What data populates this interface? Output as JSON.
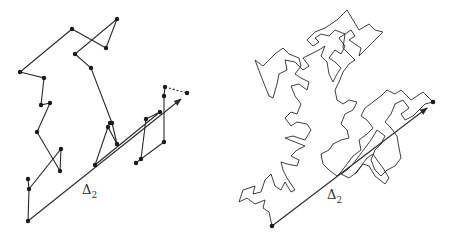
{
  "figure": {
    "left": {
      "label_symbol": "Δ",
      "label_subscript": "2",
      "label_pos": [
        82,
        182
      ],
      "walk_path": [
        [
          28,
          179
        ],
        [
          29,
          189
        ],
        [
          28,
          221
        ]
      ],
      "walk_main": [
        [
          29,
          189
        ],
        [
          61,
          149
        ],
        [
          60,
          171
        ],
        [
          37,
          132
        ],
        [
          50,
          103
        ],
        [
          41,
          105
        ],
        [
          44,
          78
        ],
        [
          20,
          72
        ],
        [
          72,
          29
        ],
        [
          106,
          48
        ],
        [
          117,
          19
        ],
        [
          75,
          54
        ],
        [
          91,
          68
        ],
        [
          112,
          123
        ],
        [
          117,
          144
        ],
        [
          108,
          127
        ],
        [
          95,
          165
        ],
        [
          160,
          112
        ],
        [
          146,
          119
        ],
        [
          141,
          159
        ],
        [
          164,
          142
        ],
        [
          164,
          96
        ],
        [
          165,
          87
        ]
      ],
      "walk_tail": [
        [
          136,
          163
        ],
        [
          141,
          159
        ]
      ],
      "dashed_segment": [
        [
          165,
          87
        ],
        [
          187,
          93
        ]
      ],
      "vertices": [
        [
          28,
          221
        ],
        [
          29,
          189
        ],
        [
          28,
          179
        ],
        [
          61,
          149
        ],
        [
          60,
          171
        ],
        [
          37,
          132
        ],
        [
          50,
          103
        ],
        [
          41,
          105
        ],
        [
          44,
          78
        ],
        [
          20,
          72
        ],
        [
          72,
          29
        ],
        [
          106,
          48
        ],
        [
          117,
          19
        ],
        [
          75,
          54
        ],
        [
          91,
          68
        ],
        [
          112,
          123
        ],
        [
          117,
          144
        ],
        [
          108,
          127
        ],
        [
          110,
          123
        ],
        [
          95,
          165
        ],
        [
          160,
          112
        ],
        [
          146,
          119
        ],
        [
          141,
          159
        ],
        [
          136,
          163
        ],
        [
          164,
          142
        ],
        [
          164,
          96
        ],
        [
          165,
          87
        ],
        [
          187,
          93
        ]
      ],
      "displacement": {
        "from": [
          28,
          221
        ],
        "to": [
          181,
          99
        ]
      }
    },
    "right": {
      "label_symbol": "Δ",
      "label_subscript": "2",
      "label_pos": [
        102,
        187
      ],
      "start_dot": [
        47,
        226
      ],
      "end_dot": [
        208,
        102
      ],
      "displacement": {
        "from": [
          47,
          226
        ],
        "to": [
          202,
          108
        ]
      },
      "walk": [
        [
          47,
          226
        ],
        [
          44,
          212
        ],
        [
          38,
          208
        ],
        [
          40,
          200
        ],
        [
          30,
          204
        ],
        [
          22,
          198
        ],
        [
          14,
          202
        ],
        [
          18,
          190
        ],
        [
          30,
          186
        ],
        [
          28,
          194
        ],
        [
          36,
          192
        ],
        [
          40,
          180
        ],
        [
          46,
          174
        ],
        [
          50,
          186
        ],
        [
          56,
          190
        ],
        [
          60,
          182
        ],
        [
          66,
          192
        ],
        [
          70,
          190
        ],
        [
          62,
          178
        ],
        [
          58,
          170
        ],
        [
          56,
          162
        ],
        [
          62,
          164
        ],
        [
          72,
          166
        ],
        [
          74,
          160
        ],
        [
          66,
          156
        ],
        [
          72,
          150
        ],
        [
          80,
          146
        ],
        [
          70,
          142
        ],
        [
          60,
          138
        ],
        [
          68,
          136
        ],
        [
          80,
          140
        ],
        [
          86,
          130
        ],
        [
          82,
          124
        ],
        [
          72,
          122
        ],
        [
          66,
          126
        ],
        [
          60,
          118
        ],
        [
          66,
          112
        ],
        [
          72,
          114
        ],
        [
          76,
          104
        ],
        [
          70,
          96
        ],
        [
          66,
          86
        ],
        [
          74,
          84
        ],
        [
          82,
          90
        ],
        [
          84,
          82
        ],
        [
          76,
          78
        ],
        [
          70,
          74
        ],
        [
          76,
          66
        ],
        [
          74,
          58
        ],
        [
          64,
          54
        ],
        [
          58,
          48
        ],
        [
          50,
          54
        ],
        [
          38,
          66
        ],
        [
          30,
          60
        ],
        [
          36,
          76
        ],
        [
          40,
          86
        ],
        [
          44,
          96
        ],
        [
          48,
          98
        ],
        [
          52,
          84
        ],
        [
          54,
          74
        ],
        [
          62,
          70
        ],
        [
          60,
          60
        ],
        [
          70,
          62
        ],
        [
          78,
          70
        ],
        [
          84,
          66
        ],
        [
          78,
          58
        ],
        [
          86,
          54
        ],
        [
          94,
          50
        ],
        [
          100,
          46
        ],
        [
          96,
          56
        ],
        [
          102,
          62
        ],
        [
          104,
          74
        ],
        [
          108,
          82
        ],
        [
          112,
          74
        ],
        [
          116,
          68
        ],
        [
          110,
          62
        ],
        [
          104,
          58
        ],
        [
          110,
          50
        ],
        [
          116,
          54
        ],
        [
          120,
          46
        ],
        [
          114,
          38
        ],
        [
          120,
          34
        ],
        [
          110,
          30
        ],
        [
          104,
          36
        ],
        [
          96,
          34
        ],
        [
          90,
          38
        ],
        [
          94,
          42
        ],
        [
          88,
          46
        ],
        [
          82,
          40
        ],
        [
          90,
          32
        ],
        [
          100,
          28
        ],
        [
          112,
          20
        ],
        [
          122,
          10
        ],
        [
          128,
          20
        ],
        [
          134,
          30
        ],
        [
          144,
          24
        ],
        [
          150,
          30
        ],
        [
          158,
          32
        ],
        [
          152,
          38
        ],
        [
          146,
          44
        ],
        [
          140,
          50
        ],
        [
          134,
          56
        ],
        [
          136,
          48
        ],
        [
          130,
          44
        ],
        [
          124,
          40
        ],
        [
          130,
          36
        ],
        [
          126,
          30
        ],
        [
          120,
          34
        ],
        [
          118,
          48
        ],
        [
          124,
          54
        ],
        [
          130,
          60
        ],
        [
          124,
          64
        ],
        [
          118,
          72
        ],
        [
          114,
          82
        ],
        [
          110,
          90
        ],
        [
          112,
          100
        ],
        [
          118,
          104
        ],
        [
          124,
          100
        ],
        [
          132,
          102
        ],
        [
          128,
          110
        ],
        [
          120,
          114
        ],
        [
          116,
          124
        ],
        [
          122,
          130
        ],
        [
          124,
          138
        ],
        [
          116,
          140
        ],
        [
          108,
          144
        ],
        [
          104,
          150
        ],
        [
          96,
          154
        ],
        [
          98,
          164
        ],
        [
          104,
          170
        ],
        [
          112,
          176
        ],
        [
          116,
          172
        ],
        [
          122,
          164
        ],
        [
          128,
          156
        ],
        [
          136,
          150
        ],
        [
          134,
          140
        ],
        [
          142,
          134
        ],
        [
          148,
          128
        ],
        [
          142,
          120
        ],
        [
          136,
          116
        ],
        [
          140,
          108
        ],
        [
          148,
          102
        ],
        [
          156,
          96
        ],
        [
          162,
          90
        ],
        [
          170,
          94
        ],
        [
          176,
          90
        ],
        [
          182,
          96
        ],
        [
          186,
          100
        ],
        [
          192,
          96
        ],
        [
          198,
          92
        ],
        [
          204,
          98
        ],
        [
          208,
          102
        ],
        [
          200,
          104
        ],
        [
          194,
          110
        ],
        [
          188,
          116
        ],
        [
          180,
          120
        ],
        [
          176,
          114
        ],
        [
          184,
          108
        ],
        [
          178,
          100
        ],
        [
          170,
          104
        ],
        [
          166,
          114
        ],
        [
          160,
          122
        ],
        [
          166,
          128
        ],
        [
          172,
          136
        ],
        [
          174,
          148
        ],
        [
          176,
          158
        ],
        [
          170,
          166
        ],
        [
          162,
          170
        ],
        [
          156,
          176
        ],
        [
          150,
          170
        ],
        [
          146,
          160
        ],
        [
          150,
          150
        ],
        [
          156,
          144
        ],
        [
          160,
          136
        ],
        [
          152,
          130
        ],
        [
          146,
          140
        ],
        [
          140,
          148
        ],
        [
          134,
          156
        ],
        [
          128,
          164
        ],
        [
          122,
          170
        ],
        [
          116,
          174
        ],
        [
          124,
          178
        ],
        [
          132,
          172
        ],
        [
          138,
          164
        ],
        [
          144,
          166
        ],
        [
          150,
          176
        ],
        [
          160,
          184
        ],
        [
          164,
          178
        ],
        [
          158,
          168
        ],
        [
          152,
          160
        ],
        [
          148,
          154
        ],
        [
          142,
          158
        ],
        [
          136,
          166
        ],
        [
          130,
          174
        ]
      ]
    }
  }
}
